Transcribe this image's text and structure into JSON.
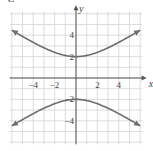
{
  "part_label": "c.",
  "chart_data": {
    "type": "line",
    "title": "",
    "xlabel": "x",
    "ylabel": "y",
    "xlim": [
      -6.2,
      6.2
    ],
    "ylim": [
      -6.2,
      6.2
    ],
    "grid": true,
    "x_ticks": [
      -4,
      -2,
      2,
      4
    ],
    "y_ticks": [
      4,
      2,
      -2,
      -4
    ],
    "x_tick_labels": [
      "−4",
      "−2",
      "2",
      "4"
    ],
    "y_tick_labels": [
      "4",
      "2",
      "−2",
      "−4"
    ],
    "equation": "y^2/4 - x^2/9 = 1",
    "series": [
      {
        "name": "upper branch",
        "x": [
          -6,
          -4,
          -2,
          0,
          2,
          4,
          6
        ],
        "y": [
          4.47,
          3.33,
          2.4,
          2.0,
          2.4,
          3.33,
          4.47
        ]
      },
      {
        "name": "lower branch",
        "x": [
          -6,
          -4,
          -2,
          0,
          2,
          4,
          6
        ],
        "y": [
          -4.47,
          -3.33,
          -2.4,
          -2.0,
          -2.4,
          -3.33,
          -4.47
        ]
      }
    ],
    "colors": {
      "curve": "#6b6b6b",
      "grid": "#d4d4d4",
      "axis": "#555555"
    }
  }
}
